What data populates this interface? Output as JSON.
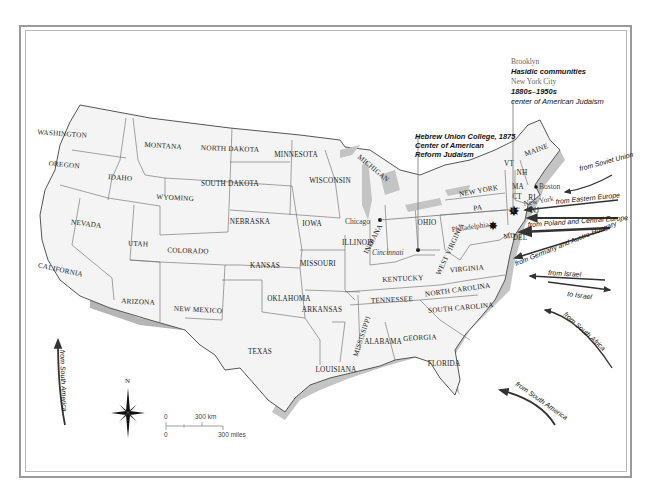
{
  "map": {
    "title": "",
    "states": [
      {
        "name": "WASHINGTON",
        "x": 62,
        "y": 136,
        "rot": 4
      },
      {
        "name": "OREGON",
        "x": 64,
        "y": 167,
        "rot": 5
      },
      {
        "name": "IDAHO",
        "x": 120,
        "y": 180,
        "rot": 5
      },
      {
        "name": "MONTANA",
        "x": 163,
        "y": 148,
        "rot": 4
      },
      {
        "name": "WYOMING",
        "x": 175,
        "y": 200,
        "rot": 3
      },
      {
        "name": "NORTH DAKOTA",
        "x": 230,
        "y": 151,
        "rot": 2
      },
      {
        "name": "SOUTH DAKOTA",
        "x": 230,
        "y": 186,
        "rot": 0
      },
      {
        "name": "MINNESOTA",
        "x": 296,
        "y": 157,
        "rot": 0
      },
      {
        "name": "WISCONSIN",
        "x": 330,
        "y": 183,
        "rot": 0
      },
      {
        "name": "NEBRASKA",
        "x": 250,
        "y": 224,
        "rot": 0
      },
      {
        "name": "IOWA",
        "x": 312,
        "y": 226,
        "rot": 0
      },
      {
        "name": "NEVADA",
        "x": 86,
        "y": 226,
        "rot": 7
      },
      {
        "name": "UTAH",
        "x": 138,
        "y": 246,
        "rot": 3
      },
      {
        "name": "COLORADO",
        "x": 188,
        "y": 253,
        "rot": 2
      },
      {
        "name": "KANSAS",
        "x": 265,
        "y": 268,
        "rot": 0
      },
      {
        "name": "MISSOURI",
        "x": 318,
        "y": 266,
        "rot": 0
      },
      {
        "name": "ILLINOIS",
        "x": 358,
        "y": 245,
        "rot": 0
      },
      {
        "name": "INDIANA",
        "x": 375,
        "y": 240,
        "rot": -62
      },
      {
        "name": "OHIO",
        "x": 427,
        "y": 225,
        "rot": 0
      },
      {
        "name": "CALIFORNIA",
        "x": 60,
        "y": 272,
        "rot": 12
      },
      {
        "name": "ARIZONA",
        "x": 138,
        "y": 304,
        "rot": 3
      },
      {
        "name": "NEW MEXICO",
        "x": 198,
        "y": 312,
        "rot": 3
      },
      {
        "name": "OKLAHOMA",
        "x": 289,
        "y": 301,
        "rot": 0
      },
      {
        "name": "TEXAS",
        "x": 260,
        "y": 354,
        "rot": 0
      },
      {
        "name": "ARKANSAS",
        "x": 322,
        "y": 312,
        "rot": 0
      },
      {
        "name": "LOUISIANA",
        "x": 336,
        "y": 372,
        "rot": 0
      },
      {
        "name": "MISSISSIPPI",
        "x": 364,
        "y": 337,
        "rot": -72
      },
      {
        "name": "ALABAMA",
        "x": 383,
        "y": 344,
        "rot": 0
      },
      {
        "name": "GEORGIA",
        "x": 420,
        "y": 340,
        "rot": -3
      },
      {
        "name": "FLORIDA",
        "x": 444,
        "y": 366,
        "rot": 0
      },
      {
        "name": "TENNESSEE",
        "x": 392,
        "y": 302,
        "rot": -3
      },
      {
        "name": "KENTUCKY",
        "x": 403,
        "y": 281,
        "rot": -3
      },
      {
        "name": "NORTH CAROLINA",
        "x": 458,
        "y": 292,
        "rot": -8
      },
      {
        "name": "SOUTH CAROLINA",
        "x": 461,
        "y": 310,
        "rot": -5
      },
      {
        "name": "WEST VIRGINIA",
        "x": 452,
        "y": 250,
        "rot": -65
      },
      {
        "name": "VIRGINIA",
        "x": 467,
        "y": 271,
        "rot": -5
      },
      {
        "name": "NEW YORK",
        "x": 479,
        "y": 193,
        "rot": -10
      },
      {
        "name": "PA",
        "x": 478,
        "y": 210,
        "rot": -5
      },
      {
        "name": "MAINE",
        "x": 537,
        "y": 152,
        "rot": -20
      },
      {
        "name": "VT",
        "x": 509,
        "y": 166,
        "rot": 0
      },
      {
        "name": "NH",
        "x": 522,
        "y": 175,
        "rot": 0
      },
      {
        "name": "MA",
        "x": 518,
        "y": 189,
        "rot": 0
      },
      {
        "name": "CT",
        "x": 517,
        "y": 199,
        "rot": 0
      },
      {
        "name": "RI",
        "x": 532,
        "y": 200,
        "rot": 0
      },
      {
        "name": "NJ",
        "x": 535,
        "y": 213,
        "rot": 0
      },
      {
        "name": "MD",
        "x": 510,
        "y": 238,
        "rot": -10
      },
      {
        "name": "DEL",
        "x": 520,
        "y": 240,
        "rot": 0
      },
      {
        "name": "MICHIGAN",
        "x": 372,
        "y": 170,
        "rot": 40
      }
    ],
    "cities": [
      {
        "name": "Chicago",
        "x": 334,
        "y": 224,
        "dot_x": 380,
        "dot_y": 220
      },
      {
        "name": "Cincinnati",
        "x": 373,
        "y": 252,
        "dot_x": 418,
        "dot_y": 250
      },
      {
        "name": "Philadelphia",
        "x": 450,
        "y": 231,
        "dot_x": 494,
        "dot_y": 226
      },
      {
        "name": "Boston",
        "x": 534,
        "y": 190,
        "dot_x": 537,
        "dot_y": 188
      },
      {
        "name": "New York",
        "x": 532,
        "y": 207,
        "dot_x": 513,
        "dot_y": 212
      }
    ],
    "annotations": {
      "brooklyn": "Brooklyn",
      "hasidic": "Hasidic communities",
      "nyc": "New York City",
      "nyc_years": "1880s–1950s",
      "nyc_desc": "center of American Judaism",
      "huc_line1": "Hebrew Union College, 1875",
      "huc_line2": "Center of American",
      "huc_line3": "Reform Judaism"
    },
    "flows": [
      {
        "label": "from Soviet Union",
        "direction": "in"
      },
      {
        "label": "from Eastern Europe",
        "direction": "in"
      },
      {
        "label": "from Poland and Central Europe",
        "direction": "in"
      },
      {
        "label": "from Germany and Austro-Hungary",
        "direction": "in"
      },
      {
        "label": "from Israel",
        "direction": "in"
      },
      {
        "label": "to Israel",
        "direction": "out"
      },
      {
        "label": "from South Africa",
        "direction": "in"
      },
      {
        "label": "from South America",
        "direction": "in"
      },
      {
        "label": "from South America",
        "direction": "in",
        "position": "west"
      }
    ],
    "compass": {
      "label": "N",
      "icon": "compass-rose-icon"
    },
    "scale": {
      "km_zero": "0",
      "km_label": "300 km",
      "mi_zero": "0",
      "mi_label": "300 miles"
    },
    "colors": {
      "land": "#f4f4f4",
      "border": "#555555",
      "coast_shadow": "#b0b0b0",
      "water": "#ffffff",
      "frame": "#9a9a9a",
      "arrow": "#333333"
    }
  }
}
